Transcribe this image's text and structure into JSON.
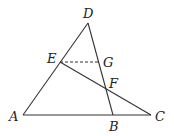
{
  "diagram": {
    "type": "geometry",
    "points": {
      "A": {
        "label": "A",
        "x": 23,
        "y": 115,
        "lx": 9,
        "ly": 121
      },
      "B": {
        "label": "B",
        "x": 113,
        "y": 115,
        "lx": 109,
        "ly": 131
      },
      "C": {
        "label": "C",
        "x": 151,
        "y": 115,
        "lx": 155,
        "ly": 121
      },
      "D": {
        "label": "D",
        "x": 88,
        "y": 23,
        "lx": 83,
        "ly": 18
      },
      "E": {
        "label": "E",
        "x": 60,
        "y": 62,
        "lx": 47,
        "ly": 63
      },
      "F": {
        "label": "F",
        "x": 106,
        "y": 89,
        "lx": 109,
        "ly": 88
      },
      "G": {
        "label": "G",
        "x": 100,
        "y": 62,
        "lx": 103,
        "ly": 67
      }
    },
    "segments": [
      {
        "from": "A",
        "to": "D",
        "style": "solid"
      },
      {
        "from": "D",
        "to": "B",
        "style": "solid"
      },
      {
        "from": "A",
        "to": "C",
        "style": "solid"
      },
      {
        "from": "E",
        "to": "C",
        "style": "solid"
      },
      {
        "from": "E",
        "to": "G",
        "style": "dashed"
      }
    ],
    "colors": {
      "line": "#333333",
      "label": "#222222",
      "background": "#ffffff"
    }
  }
}
